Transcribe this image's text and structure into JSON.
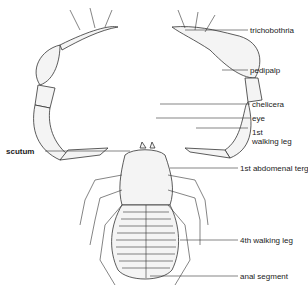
{
  "diagram": {
    "labels": {
      "trichobothria": "trichobothria",
      "pedipalp": "pedipalp",
      "chelicera": "chelicera",
      "eye": "eye",
      "walking_leg_1_line1": "1st",
      "walking_leg_1_line2": "walking leg",
      "scutum": "scutum",
      "abdominal_tergite_1": "1st abdomenal tergite",
      "walking_leg_4": "4th walking leg",
      "anal_segment": "anal segment"
    },
    "colors": {
      "line": "#333333",
      "fill": "#f4f4f4",
      "text": "#222222"
    }
  }
}
